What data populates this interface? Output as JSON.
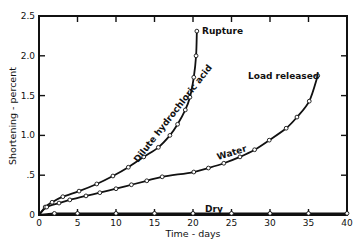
{
  "chart_data": {
    "type": "line",
    "title": "",
    "xlabel": "Time - days",
    "ylabel": "Shortening - percent",
    "xlim": [
      0,
      40
    ],
    "ylim": [
      0,
      2.5
    ],
    "xticks": [
      0,
      5,
      10,
      15,
      20,
      25,
      30,
      35,
      40
    ],
    "xtick_labels": [
      "0",
      "5",
      "10",
      "15",
      "20",
      "25",
      "30",
      "35",
      "40"
    ],
    "yticks": [
      0,
      0.5,
      1.0,
      1.5,
      2.0,
      2.5
    ],
    "ytick_labels": [
      "0",
      ".5",
      "1.0",
      "1.5",
      "2.0",
      "2.5"
    ],
    "grid": false,
    "legend": "none",
    "series": [
      {
        "name": "Dilute hydrochloric acid",
        "x": [
          0,
          0.8,
          1.7,
          3.1,
          5.2,
          7.5,
          9.6,
          11.6,
          13.6,
          15.5,
          17,
          18,
          19,
          19.6,
          20.1,
          20.4,
          20.5
        ],
        "y": [
          0,
          0.1,
          0.16,
          0.23,
          0.3,
          0.39,
          0.49,
          0.6,
          0.73,
          0.85,
          1.0,
          1.14,
          1.32,
          1.48,
          1.73,
          2.0,
          2.31
        ]
      },
      {
        "name": "Water",
        "x": [
          0,
          1,
          2.6,
          4,
          6.1,
          7.9,
          10,
          12,
          14,
          16,
          20.1,
          22,
          24,
          26.1,
          28,
          29.9,
          32.1,
          33.5,
          35.1,
          36.2
        ],
        "y": [
          0,
          0.1,
          0.15,
          0.19,
          0.24,
          0.28,
          0.33,
          0.38,
          0.43,
          0.48,
          0.54,
          0.59,
          0.65,
          0.73,
          0.82,
          0.94,
          1.09,
          1.23,
          1.43,
          1.75
        ]
      },
      {
        "name": "Dry",
        "x": [
          0,
          2,
          5,
          10,
          15,
          20,
          25,
          30,
          35,
          40
        ],
        "y": [
          0,
          0.02,
          0.02,
          0.02,
          0.02,
          0.02,
          0.02,
          0.02,
          0.02,
          0.02
        ]
      }
    ],
    "annotations": [
      {
        "text": "Rupture",
        "series": "Dilute hydrochloric acid",
        "at": [
          20.5,
          2.31
        ]
      },
      {
        "text": "Load released",
        "series": "Water",
        "at": [
          36.2,
          1.75
        ]
      },
      {
        "text": "Dilute hydrochloric acid",
        "series": "Dilute hydrochloric acid",
        "along_curve": true
      },
      {
        "text": "Water",
        "series": "Water",
        "along_curve": true
      },
      {
        "text": "Dry",
        "series": "Dry",
        "along_curve": true
      }
    ]
  }
}
